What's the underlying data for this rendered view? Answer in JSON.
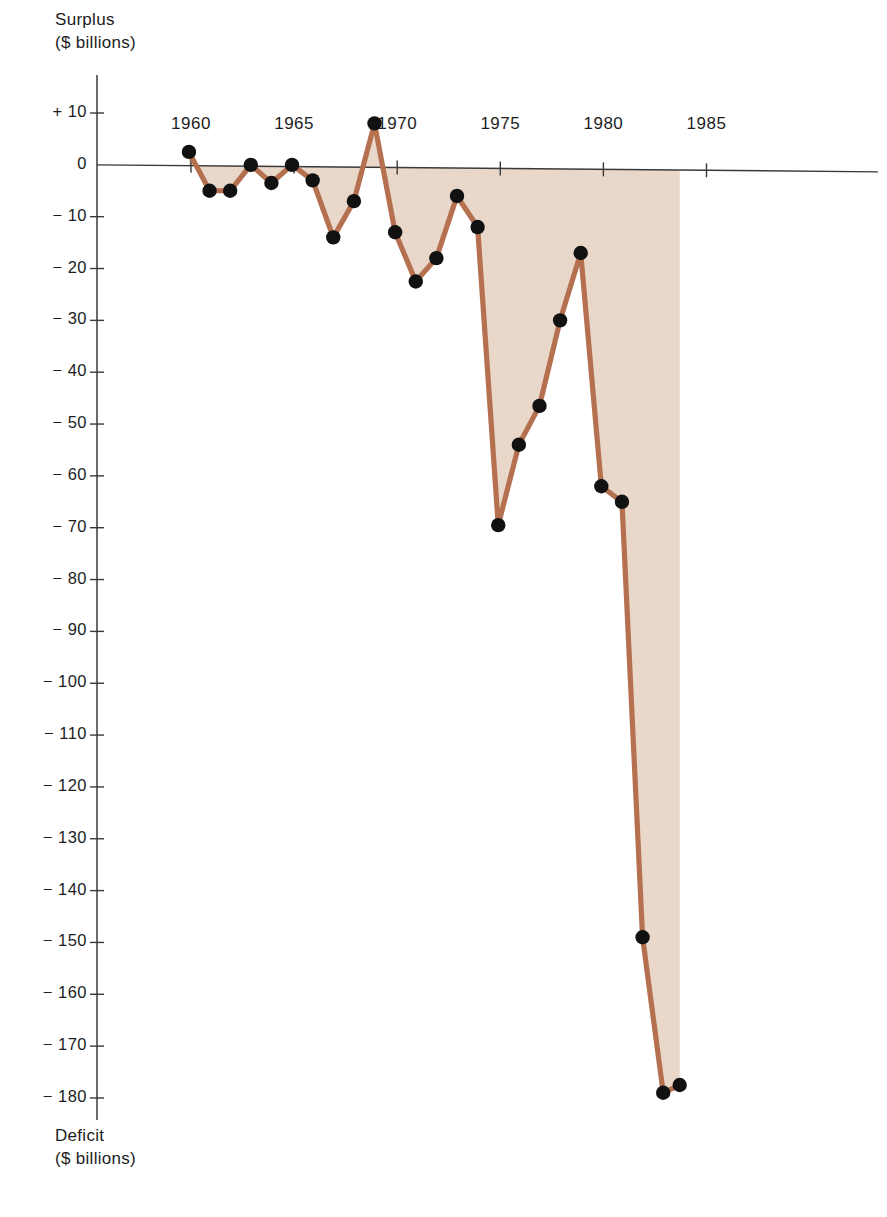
{
  "axes": {
    "top_caption_line1": "Surplus",
    "top_caption_line2": "($ billions)",
    "bottom_caption_line1": "Deficit",
    "bottom_caption_line2": "($ billions)",
    "y_tick_labels": [
      "+ 10",
      "0",
      "− 10",
      "− 20",
      "− 30",
      "− 40",
      "− 50",
      "− 60",
      "− 70",
      "− 80",
      "− 90",
      "− 100",
      "− 110",
      "− 120",
      "− 130",
      "− 140",
      "− 150",
      "− 160",
      "− 170",
      "− 180"
    ],
    "x_tick_labels": [
      "1960",
      "1965",
      "1970",
      "1975",
      "1980",
      "1985"
    ]
  },
  "colors": {
    "line": "#b57050",
    "fill": "#e8d5c6",
    "marker": "#111111",
    "axis": "#3a3a3a",
    "text": "#1d1d1d"
  },
  "chart_data": {
    "type": "line",
    "title": "",
    "subtitle": "",
    "xlabel": "",
    "ylabel": "Surplus / Deficit ($ billions)",
    "ylim": [
      -185,
      12
    ],
    "xlim": [
      1958.8,
      1987.5
    ],
    "grid": false,
    "legend": null,
    "y_ticks": [
      10,
      0,
      -10,
      -20,
      -30,
      -40,
      -50,
      -60,
      -70,
      -80,
      -90,
      -100,
      -110,
      -120,
      -130,
      -140,
      -150,
      -160,
      -170,
      -180
    ],
    "x_ticks": [
      1960,
      1965,
      1970,
      1975,
      1980,
      1985
    ],
    "fill_to_zero": true,
    "x": [
      1959.9,
      1960.9,
      1961.9,
      1962.9,
      1963.9,
      1964.9,
      1965.9,
      1966.9,
      1967.9,
      1968.9,
      1969.9,
      1970.9,
      1971.9,
      1972.9,
      1973.9,
      1974.9,
      1975.9,
      1976.9,
      1977.9,
      1978.9,
      1979.9,
      1980.9,
      1981.9,
      1982.9,
      1983.7
    ],
    "values": [
      2.5,
      -5.0,
      -5.0,
      0.0,
      -3.5,
      0.0,
      -3.0,
      -14.0,
      -7.0,
      8.0,
      -13.0,
      -22.5,
      -18.0,
      -6.0,
      -12.0,
      -69.5,
      -54.0,
      -46.5,
      -30.0,
      -17.0,
      -62.0,
      -65.0,
      -149.0,
      -179.0,
      -177.5
    ],
    "series_name": "Federal budget surplus/deficit",
    "annotations": []
  }
}
